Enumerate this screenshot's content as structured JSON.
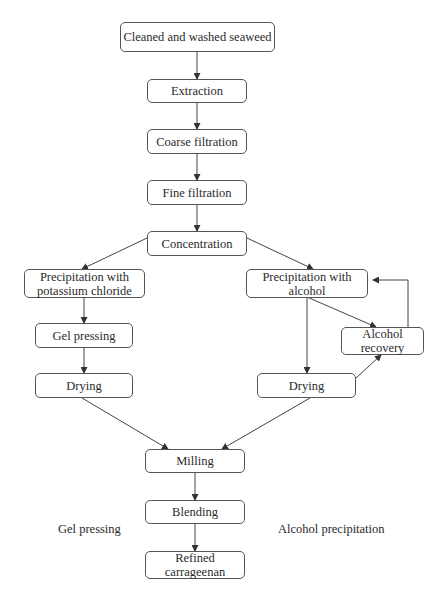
{
  "nodes": {
    "cleaned": "Cleaned and washed seaweed",
    "extraction": "Extraction",
    "coarse": "Coarse filtration",
    "fine": "Fine filtration",
    "concentration": "Concentration",
    "precip_kcl_1": "Precipitation with",
    "precip_kcl_2": "potassium chloride",
    "precip_alc_1": "Precipitation with",
    "precip_alc_2": "alcohol",
    "gel_pressing": "Gel pressing",
    "alc_recovery_1": "Alcohol",
    "alc_recovery_2": "recovery",
    "drying_left": "Drying",
    "drying_right": "Drying",
    "milling": "Milling",
    "blending": "Blending",
    "refined_1": "Refined",
    "refined_2": "carrageenan"
  },
  "labels": {
    "left_route": "Gel pressing",
    "right_route": "Alcohol precipitation"
  }
}
